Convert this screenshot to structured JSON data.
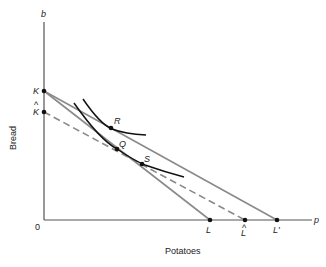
{
  "diagram": {
    "type": "indifference-curve-budget-line",
    "axes": {
      "y_label": "Bread",
      "y_symbol": "b",
      "x_label": "Potatoes",
      "x_symbol": "p",
      "origin_label": "0"
    },
    "points": {
      "K": "K",
      "K_hat": "K",
      "L": "L",
      "L_hat": "L",
      "L_prime": "L'",
      "R": "R",
      "Q": "Q",
      "S": "S"
    },
    "hat_mark": "^",
    "colors": {
      "axis": "#555555",
      "budget_line": "#8a8a8a",
      "indifference_curve": "#111111"
    },
    "lines": [
      {
        "name": "budget-K-L",
        "from": "K",
        "to": "L",
        "style": "solid"
      },
      {
        "name": "budget-K-Lprime",
        "from": "K",
        "to": "L'",
        "style": "solid"
      },
      {
        "name": "compensated-Khat-Lhat",
        "from": "K^",
        "to": "L^",
        "style": "dashed"
      }
    ],
    "curves": [
      {
        "name": "upper-indifference-curve",
        "through": "R"
      },
      {
        "name": "lower-indifference-curve",
        "through": [
          "Q",
          "S"
        ]
      }
    ]
  }
}
